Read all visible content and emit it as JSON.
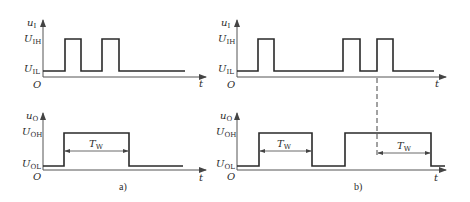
{
  "figure": {
    "panels": [
      {
        "caption": "a)",
        "input": {
          "y_axis_label": "u",
          "y_axis_sub": "I",
          "levels": [
            {
              "label": "U",
              "sub": "IH"
            },
            {
              "label": "U",
              "sub": "IL"
            }
          ],
          "x_axis_label": "t",
          "origin_label": "O",
          "pulses_x": [
            [
              65,
              81
            ],
            [
              102,
              119
            ]
          ]
        },
        "output": {
          "y_axis_label": "u",
          "y_axis_sub": "O",
          "levels": [
            {
              "label": "U",
              "sub": "OH"
            },
            {
              "label": "U",
              "sub": "OL"
            }
          ],
          "x_axis_label": "t",
          "origin_label": "O",
          "width_label": "T",
          "width_sub": "W"
        }
      },
      {
        "caption": "b)",
        "input": {
          "y_axis_label": "u",
          "y_axis_sub": "I",
          "levels": [
            {
              "label": "U",
              "sub": "IH"
            },
            {
              "label": "U",
              "sub": "IL"
            }
          ],
          "x_axis_label": "t",
          "origin_label": "O"
        },
        "output": {
          "y_axis_label": "u",
          "y_axis_sub": "O",
          "levels": [
            {
              "label": "U",
              "sub": "OH"
            },
            {
              "label": "U",
              "sub": "OL"
            }
          ],
          "x_axis_label": "t",
          "origin_label": "O",
          "width_label": "T",
          "width_sub": "W"
        }
      }
    ]
  }
}
